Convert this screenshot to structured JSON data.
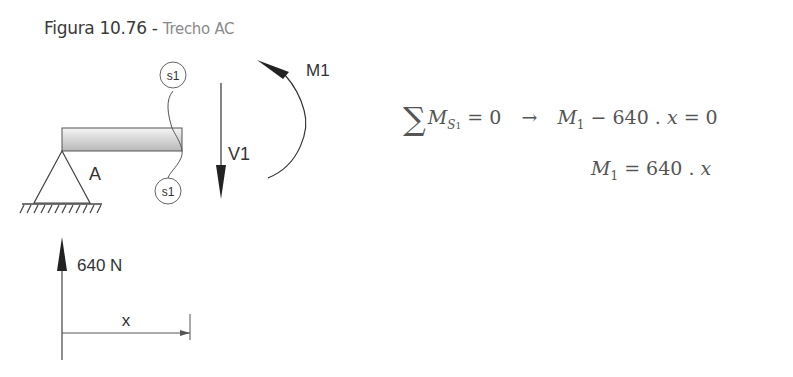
{
  "figure": {
    "caption_prefix": "Figura 10.76 - ",
    "caption_title": "Trecho AC"
  },
  "diagram": {
    "support_label": "A",
    "section_label_top": "s1",
    "section_label_bottom": "s1",
    "shear_label": "V1",
    "moment_label": "M1",
    "reaction_label": "640 N",
    "distance_label": "x"
  },
  "equations": {
    "line1": {
      "sum_symbol": "∑",
      "lhs_var": "M",
      "lhs_sub": "S",
      "lhs_subsub": "1",
      "lhs_eq": " = 0",
      "arrow": "→",
      "rhs_var": "M",
      "rhs_sub": "1",
      "rhs_expr": " − 640 . ",
      "rhs_x": "x",
      "rhs_eq": " = 0"
    },
    "line2": {
      "var": "M",
      "sub": "1",
      "expr": " = 640 . ",
      "x": "x"
    }
  }
}
